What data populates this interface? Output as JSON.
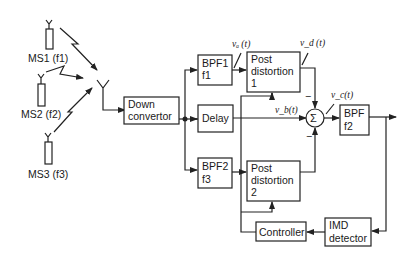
{
  "diagram": {
    "type": "block-diagram",
    "mobile_stations": [
      {
        "label": "MS1 (f1)",
        "name": "MS1",
        "freq": "f1"
      },
      {
        "label": "MS2 (f2)",
        "name": "MS2",
        "freq": "f2"
      },
      {
        "label": "MS3 (f3)",
        "name": "MS3",
        "freq": "f3"
      }
    ],
    "blocks": {
      "down_convertor": {
        "line1": "Down",
        "line2": "convertor"
      },
      "bpf1": {
        "line1": "BPF1",
        "line2": "f1"
      },
      "delay": {
        "line1": "Delay"
      },
      "bpf2": {
        "line1": "BPF2",
        "line2": "f3"
      },
      "post_distortion_1": {
        "line1": "Post",
        "line2": "distortion",
        "line3": "1"
      },
      "post_distortion_2": {
        "line1": "Post",
        "line2": "distortion",
        "line3": "2"
      },
      "summer": {
        "symbol": "Σ"
      },
      "bpf_out": {
        "line1": "BPF",
        "line2": "f2"
      },
      "controller": {
        "line1": "Controller"
      },
      "imd_detector": {
        "line1": "IMD",
        "line2": "detector"
      }
    },
    "signals": {
      "va": "vₐ (t)",
      "vb": "v_b(t)",
      "vc": "v_c(t)",
      "vd": "v_d (t)",
      "minus": "−"
    },
    "edges": [
      {
        "from": "MS1",
        "to": "receive-antenna"
      },
      {
        "from": "MS2",
        "to": "receive-antenna"
      },
      {
        "from": "MS3",
        "to": "receive-antenna"
      },
      {
        "from": "receive-antenna",
        "to": "down_convertor"
      },
      {
        "from": "down_convertor",
        "to": "bpf1"
      },
      {
        "from": "down_convertor",
        "to": "delay"
      },
      {
        "from": "down_convertor",
        "to": "bpf2"
      },
      {
        "from": "bpf1",
        "to": "post_distortion_1",
        "signal": "va"
      },
      {
        "from": "bpf2",
        "to": "post_distortion_2"
      },
      {
        "from": "post_distortion_1",
        "to": "summer",
        "signal": "vd",
        "sign": "-"
      },
      {
        "from": "delay",
        "to": "summer",
        "signal": "vb",
        "sign": "+"
      },
      {
        "from": "post_distortion_2",
        "to": "summer",
        "sign": "-"
      },
      {
        "from": "summer",
        "to": "bpf_out",
        "signal": "vc"
      },
      {
        "from": "bpf_out",
        "to": "output"
      },
      {
        "from": "bpf_out",
        "to": "imd_detector"
      },
      {
        "from": "imd_detector",
        "to": "controller"
      },
      {
        "from": "controller",
        "to": "post_distortion_1"
      },
      {
        "from": "controller",
        "to": "post_distortion_2"
      }
    ]
  }
}
